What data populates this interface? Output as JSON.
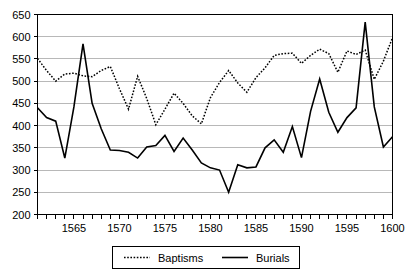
{
  "chart_data": {
    "type": "line",
    "title": "",
    "subtitle": "",
    "xlabel": "",
    "ylabel": "",
    "xlim": [
      1561,
      1600
    ],
    "ylim": [
      200,
      650
    ],
    "grid": true,
    "grid_axis": "y",
    "legend_position": "bottom",
    "y_ticks": [
      200,
      250,
      300,
      350,
      400,
      450,
      500,
      550,
      600,
      650
    ],
    "y_tick_labels": [
      "200",
      "250",
      "300",
      "350",
      "400",
      "450",
      "500",
      "550",
      "600",
      "650"
    ],
    "x_ticks": [
      1561,
      1562,
      1563,
      1564,
      1565,
      1566,
      1567,
      1568,
      1569,
      1570,
      1571,
      1572,
      1573,
      1574,
      1575,
      1576,
      1577,
      1578,
      1579,
      1580,
      1581,
      1582,
      1583,
      1584,
      1585,
      1586,
      1587,
      1588,
      1589,
      1590,
      1591,
      1592,
      1593,
      1594,
      1595,
      1596,
      1597,
      1598,
      1599,
      1600
    ],
    "x_labeled_ticks": [
      1565,
      1570,
      1575,
      1580,
      1585,
      1590,
      1595,
      1600
    ],
    "x_tick_labels": [
      "1565",
      "1570",
      "1575",
      "1580",
      "1585",
      "1590",
      "1595",
      "1600"
    ],
    "x": [
      1561,
      1562,
      1563,
      1564,
      1565,
      1566,
      1567,
      1568,
      1569,
      1570,
      1571,
      1572,
      1573,
      1574,
      1575,
      1576,
      1577,
      1578,
      1579,
      1580,
      1581,
      1582,
      1583,
      1584,
      1585,
      1586,
      1587,
      1588,
      1589,
      1590,
      1591,
      1592,
      1593,
      1594,
      1595,
      1596,
      1597,
      1598,
      1599,
      1600
    ],
    "series": [
      {
        "name": "Baptisms",
        "style": "dotted",
        "color": "#000000",
        "values": [
          551,
          524,
          500,
          516,
          518,
          512,
          510,
          524,
          533,
          483,
          437,
          511,
          461,
          402,
          437,
          473,
          450,
          422,
          404,
          463,
          497,
          524,
          496,
          475,
          508,
          530,
          558,
          562,
          563,
          540,
          558,
          572,
          562,
          520,
          568,
          560,
          570,
          504,
          545,
          598
        ]
      },
      {
        "name": "Burials",
        "style": "solid",
        "color": "#000000",
        "values": [
          440,
          418,
          410,
          327,
          442,
          584,
          450,
          393,
          345,
          344,
          340,
          327,
          352,
          355,
          378,
          342,
          372,
          345,
          316,
          305,
          300,
          250,
          312,
          305,
          307,
          350,
          368,
          340,
          398,
          328,
          432,
          505,
          430,
          385,
          418,
          440,
          633,
          442,
          352,
          375
        ]
      }
    ]
  },
  "legend": {
    "items": [
      {
        "label": "Baptisms",
        "style": "dotted"
      },
      {
        "label": "Burials",
        "style": "solid"
      }
    ]
  }
}
